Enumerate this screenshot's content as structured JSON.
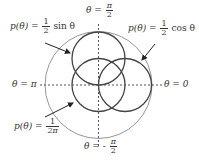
{
  "diagram": {
    "type": "polar-probability-density-circles",
    "colors": {
      "curve": "#444444",
      "outer_circle": "#888888",
      "axis": "#555555",
      "text": "#333333"
    },
    "axes": {
      "top": {
        "lhs": "θ",
        "eq": "=",
        "num": "π",
        "den": "2"
      },
      "bottom": {
        "lhs": "θ",
        "eq": "= -",
        "num": "π",
        "den": "2"
      },
      "left": {
        "text": "θ = π"
      },
      "right": {
        "text": "θ = 0"
      }
    },
    "labels": {
      "sin": {
        "lhs": "p(θ) =",
        "num": "1",
        "den": "2",
        "rhs": "sin θ"
      },
      "cos": {
        "lhs": "p(θ) =",
        "num": "1",
        "den": "2",
        "rhs": "cos θ"
      },
      "uniform": {
        "lhs": "p(θ) =",
        "num": "1",
        "den": "2π"
      }
    },
    "curves": [
      {
        "name": "sin-circle",
        "cx": 98.5,
        "cy": 58.5,
        "r": 26.5
      },
      {
        "name": "cos-circle",
        "cx": 125,
        "cy": 85,
        "r": 26.5
      },
      {
        "name": "uniform-circle",
        "cx": 98.5,
        "cy": 85,
        "r": 26.5
      },
      {
        "name": "outer-circle",
        "cx": 98.5,
        "cy": 85,
        "r": 53.5
      }
    ]
  }
}
